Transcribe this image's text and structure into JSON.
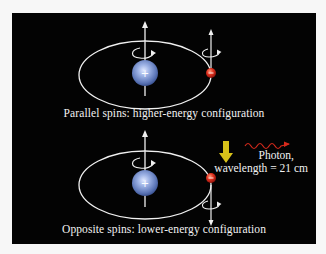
{
  "diagram": {
    "top": {
      "caption": "Parallel spins: higher-energy configuration",
      "proton_symbol": "+",
      "electron_symbol": "−",
      "proton_spin": "up",
      "electron_spin": "up"
    },
    "transition": {
      "arrow_direction": "down",
      "photon_label_line1": "Photon,",
      "photon_label_line2": "wavelength = 21 cm"
    },
    "bottom": {
      "caption": "Opposite spins: lower-energy configuration",
      "proton_symbol": "+",
      "electron_symbol": "−",
      "proton_spin": "up",
      "electron_spin": "down"
    },
    "colors": {
      "background": "#030303",
      "proton": "#7f9bd6",
      "electron": "#d8261c",
      "orbit": "#f0f0f0",
      "transition_arrow": "#d8c21a",
      "photon_wave": "#d82a1c"
    }
  }
}
